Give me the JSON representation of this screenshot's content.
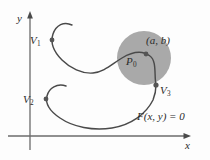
{
  "figure": {
    "type": "math-diagram",
    "axes": {
      "y_label": "y",
      "x_label": "x",
      "origin": {
        "x": 30,
        "y": 136
      },
      "x_axis": {
        "x1": 8,
        "y1": 136,
        "x2": 190,
        "y2": 136,
        "arrow": "right"
      },
      "y_axis": {
        "x1": 30,
        "y1": 150,
        "x2": 30,
        "y2": 12,
        "arrow": "up"
      }
    },
    "colors": {
      "curve": "#4a4a4a",
      "axis": "#6b6b6b",
      "disk_fill": "#a9a9a9",
      "text": "#2b2b2b",
      "marker": "#555555",
      "background": "#fdfdfd"
    },
    "disk": {
      "name": "neighborhood-disk",
      "center_x": 144,
      "center_y": 58,
      "radius": 27
    },
    "points": [
      {
        "id": "V1",
        "label": "V",
        "subscript": "1",
        "label_x": 30,
        "label_y": 41,
        "dot_x": 52,
        "dot_y": 40
      },
      {
        "id": "V2",
        "label": "V",
        "subscript": "2",
        "label_x": 23,
        "label_y": 100,
        "dot_x": 46,
        "dot_y": 99
      },
      {
        "id": "V3",
        "label": "V",
        "subscript": "3",
        "label_x": 160,
        "label_y": 91,
        "dot_x": 156,
        "dot_y": 85
      },
      {
        "id": "P0",
        "label": "P",
        "subscript": "0",
        "label_x": 126,
        "label_y": 62,
        "dot_x": 146,
        "dot_y": 54
      }
    ],
    "annotations": {
      "coordinate_label": "(a, b)",
      "coordinate_label_x": 148,
      "coordinate_label_y": 42,
      "equation_label": "F(x, y) = 0",
      "equation_label_x": 139,
      "equation_label_y": 117
    }
  }
}
